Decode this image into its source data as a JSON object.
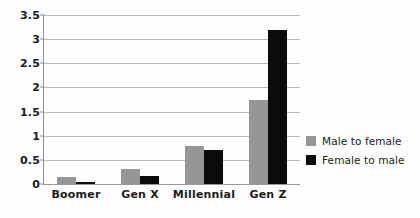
{
  "chart_data": {
    "type": "bar",
    "title": "",
    "xlabel": "",
    "ylabel": "",
    "categories": [
      "Boomer",
      "Gen X",
      "Millennial",
      "Gen Z"
    ],
    "series": [
      {
        "name": "Male to female",
        "color": "#969696",
        "values": [
          0.15,
          0.32,
          0.78,
          1.74
        ]
      },
      {
        "name": "Female to male",
        "color": "#0b0b0b",
        "values": [
          0.04,
          0.17,
          0.7,
          3.2
        ]
      }
    ],
    "ylim": [
      0,
      3.5
    ],
    "ytick_step": 0.5,
    "yticks": [
      "0",
      "0.5",
      "1",
      "1.5",
      "2",
      "2.5",
      "3",
      "3.5"
    ],
    "ytick_values": [
      0,
      0.5,
      1,
      1.5,
      2,
      2.5,
      3,
      3.5
    ],
    "grid": true,
    "legend_position": "right"
  },
  "legend": {
    "items": [
      {
        "label": "Male to female",
        "swatch_name": "legend-swatch-male-to-female"
      },
      {
        "label": "Female to male",
        "swatch_name": "legend-swatch-female-to-male"
      }
    ]
  }
}
